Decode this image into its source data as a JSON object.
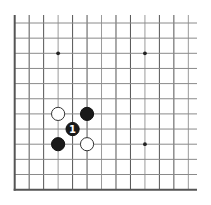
{
  "diagram": {
    "type": "go-board-fragment",
    "visible_region": "lower-left corner",
    "columns": 13,
    "rows": 12,
    "edges": [
      "left",
      "bottom"
    ],
    "colors": {
      "background": "#ffffff",
      "line": "#555555",
      "black_stone": "#1a1a1a",
      "white_stone": "#ffffff"
    },
    "star_points": [
      {
        "col": 3,
        "row": 2
      },
      {
        "col": 9,
        "row": 2
      },
      {
        "col": 9,
        "row": 8
      }
    ],
    "stones": [
      {
        "color": "white",
        "col": 3,
        "row": 6,
        "label": ""
      },
      {
        "color": "black",
        "col": 5,
        "row": 6,
        "label": ""
      },
      {
        "color": "black",
        "col": 4,
        "row": 7,
        "label": "1"
      },
      {
        "color": "black",
        "col": 3,
        "row": 8,
        "label": ""
      },
      {
        "color": "white",
        "col": 5,
        "row": 8,
        "label": ""
      }
    ]
  }
}
